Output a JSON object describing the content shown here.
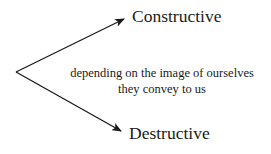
{
  "diagram": {
    "top_branch": {
      "label": "Constructive"
    },
    "bottom_branch": {
      "label": "Destructive"
    },
    "middle_note": {
      "line1": "depending on the image of ourselves",
      "line2": "they convey to us"
    },
    "colors": {
      "stroke": "#1a1a1a",
      "background": "#ffffff"
    },
    "icons": {
      "top_arrow": "arrow-up-right-icon",
      "bottom_arrow": "arrow-down-right-icon"
    }
  }
}
